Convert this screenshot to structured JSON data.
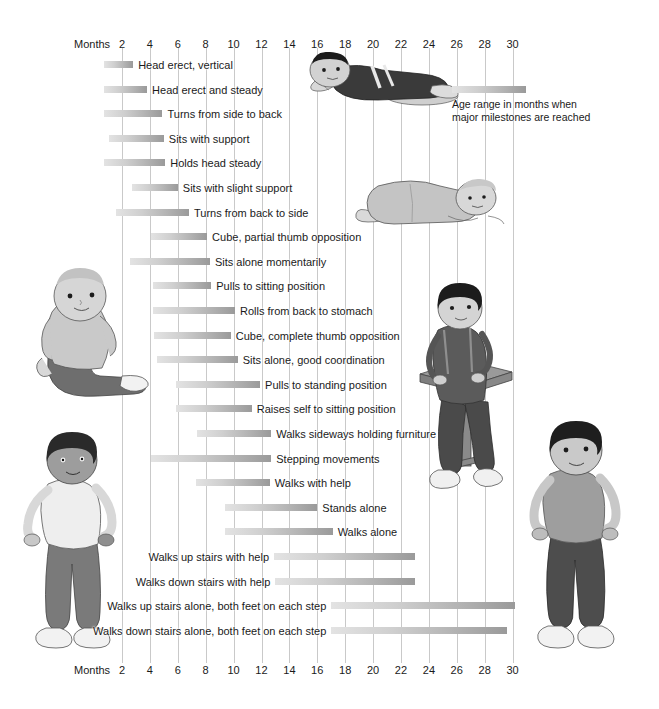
{
  "chart_data": {
    "type": "bar",
    "orientation": "horizontal-range",
    "title": "",
    "xlabel": "Months",
    "ylabel": "",
    "xlim": [
      0,
      31
    ],
    "grid": true,
    "xticks": [
      2,
      4,
      6,
      8,
      10,
      12,
      14,
      16,
      18,
      20,
      22,
      24,
      26,
      28,
      30
    ],
    "xtick_labels": [
      "2",
      "4",
      "6",
      "8",
      "10",
      "12",
      "14",
      "16",
      "18",
      "20",
      "22",
      "24",
      "26",
      "28",
      "30"
    ],
    "axis_title_top": "Months",
    "axis_title_bottom": "Months",
    "legend": {
      "position": "top-right",
      "swatch": "gradient-bar",
      "line1": "Age range in months when",
      "line2": "major milestones are reached"
    },
    "bar_gradient": [
      "#e3e3e3",
      "#cfcfcf",
      "#b3b3b3",
      "#9a9a9a"
    ],
    "gridline_color": "#c9c9c9",
    "categories": [
      "Head erect, vertical",
      "Head erect and steady",
      "Turns from side to back",
      "Sits with support",
      "Holds head steady",
      "Sits with slight support",
      "Turns from back to side",
      "Cube, partial thumb opposition",
      "Sits alone momentarily",
      "Pulls to sitting position",
      "Rolls from back to stomach",
      "Cube, complete thumb opposition",
      "Sits alone, good coordination",
      "Pulls to standing position",
      "Raises self to sitting position",
      "Walks sideways holding furniture",
      "Stepping movements",
      "Walks with help",
      "Stands alone",
      "Walks alone",
      "Walks up stairs with help",
      "Walks down stairs with help",
      "Walks up stairs alone, both feet on each step",
      "Walks down stairs alone, both feet on each step"
    ],
    "ranges": [
      {
        "label": "Head erect, vertical",
        "start": 0.7,
        "end": 2.8
      },
      {
        "label": "Head erect and steady",
        "start": 0.7,
        "end": 3.8
      },
      {
        "label": "Turns from side to back",
        "start": 0.7,
        "end": 4.9
      },
      {
        "label": "Sits with support",
        "start": 1.1,
        "end": 5.0
      },
      {
        "label": "Holds head steady",
        "start": 0.7,
        "end": 5.1
      },
      {
        "label": "Sits with slight support",
        "start": 2.7,
        "end": 6.0
      },
      {
        "label": "Turns from back to side",
        "start": 1.6,
        "end": 6.8
      },
      {
        "label": "Cube, partial thumb opposition",
        "start": 4.1,
        "end": 8.1
      },
      {
        "label": "Sits alone momentarily",
        "start": 2.6,
        "end": 8.3
      },
      {
        "label": "Pulls to sitting position",
        "start": 4.2,
        "end": 8.4
      },
      {
        "label": "Rolls from back to stomach",
        "start": 4.2,
        "end": 10.1
      },
      {
        "label": "Cube, complete thumb opposition",
        "start": 4.3,
        "end": 9.8
      },
      {
        "label": "Sits alone, good coordination",
        "start": 4.5,
        "end": 10.3
      },
      {
        "label": "Pulls to standing position",
        "start": 5.9,
        "end": 11.9
      },
      {
        "label": "Raises self to sitting position",
        "start": 5.9,
        "end": 11.3
      },
      {
        "label": "Walks sideways holding furniture",
        "start": 7.4,
        "end": 12.7
      },
      {
        "label": "Stepping movements",
        "start": 4.1,
        "end": 12.7
      },
      {
        "label": "Walks with help",
        "start": 7.3,
        "end": 12.6
      },
      {
        "label": "Stands alone",
        "start": 9.4,
        "end": 16.0
      },
      {
        "label": "Walks alone",
        "start": 9.4,
        "end": 17.1
      },
      {
        "label": "Walks up stairs with help",
        "start": 12.9,
        "end": 23.0
      },
      {
        "label": "Walks down stairs with help",
        "start": 13.0,
        "end": 23.0
      },
      {
        "label": "Walks up stairs alone, both feet on each step",
        "start": 17.0,
        "end": 30.2
      },
      {
        "label": "Walks down stairs alone, both feet on each step",
        "start": 17.0,
        "end": 29.6
      }
    ]
  },
  "illustrations": [
    {
      "name": "infant-prone-lifting-head",
      "caption": "infant lying prone, head lifted"
    },
    {
      "name": "infant-rolling",
      "caption": "infant rolling on back"
    },
    {
      "name": "infant-sitting-alone",
      "caption": "infant sitting alone"
    },
    {
      "name": "toddler-pulling-to-stand",
      "caption": "toddler pulling to standing at table"
    },
    {
      "name": "toddler-standing-left",
      "caption": "toddler standing"
    },
    {
      "name": "toddler-standing-right",
      "caption": "toddler standing"
    }
  ]
}
